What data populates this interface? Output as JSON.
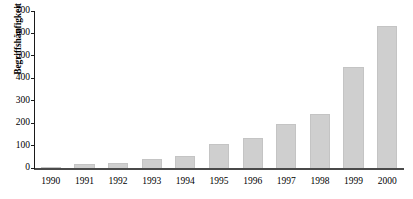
{
  "chart_data": {
    "type": "bar",
    "title": "",
    "xlabel": "",
    "ylabel": "Begriffshäufigkeit",
    "categories": [
      "1990",
      "1991",
      "1992",
      "1993",
      "1994",
      "1995",
      "1996",
      "1997",
      "1998",
      "1999",
      "2000"
    ],
    "values": [
      5,
      18,
      22,
      40,
      55,
      105,
      135,
      195,
      242,
      450,
      632
    ],
    "ylim": [
      0,
      700
    ],
    "ytick_step": 100,
    "yticks": [
      0,
      100,
      200,
      300,
      400,
      500,
      600,
      700
    ],
    "ytick_labels": [
      "0",
      "100",
      "200",
      "300",
      "400",
      "500",
      "600",
      "700"
    ],
    "grid": false,
    "legend": false,
    "legend_position": "none",
    "bar_color": "#cfcfcf",
    "bar_edge_color": "#c4c4c4",
    "axis_color": "#1a1a1a",
    "baseline_color": "#4a4a4a"
  }
}
